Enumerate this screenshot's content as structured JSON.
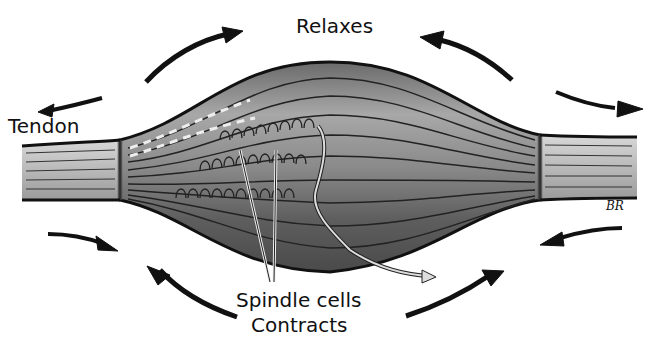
{
  "diagram": {
    "labels": {
      "top": "Relaxes",
      "left": "Tendon",
      "bottom_1": "Spindle cells",
      "bottom_2": "Contracts",
      "signature": "BR"
    },
    "arrows": {
      "top_outward": [
        "upper-left arrow pointing left (outward)",
        "upper arrow pointing right toward center-top",
        "upper arrow pointing left toward center-top",
        "upper-right arrow pointing right (outward)"
      ],
      "bottom_inward": [
        "lower-left arrow pointing right (inward)",
        "lower arrow pointing up-left",
        "lower arrow pointing up-right",
        "lower-right arrow pointing left (inward)"
      ]
    },
    "colors": {
      "outline": "#111111",
      "muscle_dark": "#5a5a5a",
      "muscle_mid": "#8c8c8c",
      "muscle_light": "#bdbdbd",
      "tendon": "#cfcfcf",
      "background": "#ffffff"
    }
  }
}
